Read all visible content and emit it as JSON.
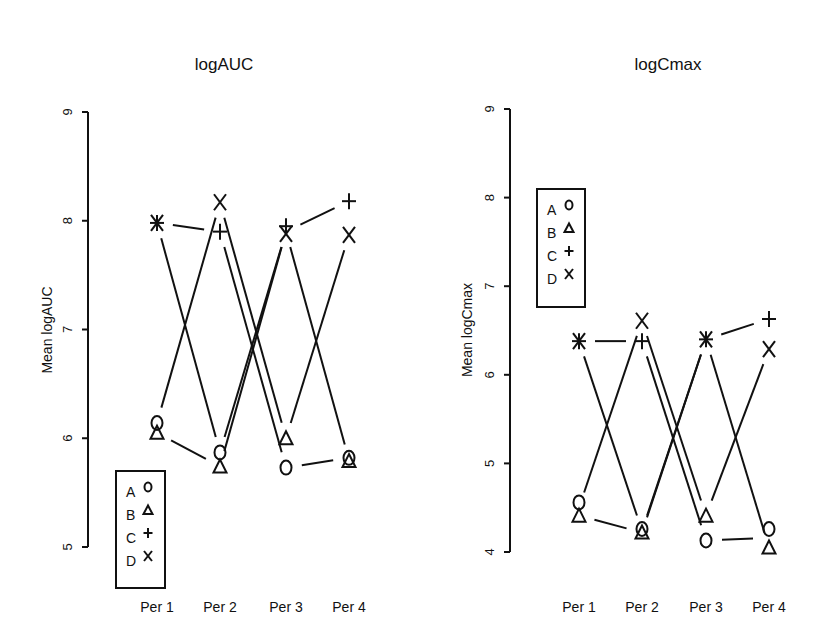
{
  "chart_data": [
    {
      "type": "line",
      "title": "logAUC",
      "xlabel": "",
      "ylabel": "Mean logAUC",
      "categories": [
        "Per 1",
        "Per 2",
        "Per 3",
        "Per 4"
      ],
      "ylim": [
        5,
        9
      ],
      "yticks": [
        5,
        6,
        7,
        8,
        9
      ],
      "grid": false,
      "legend_position": "bottom-left",
      "treatments": [
        {
          "name": "A",
          "marker": "circle",
          "values": [
            6.14,
            5.87,
            5.73,
            5.82
          ]
        },
        {
          "name": "B",
          "marker": "triangle",
          "values": [
            6.05,
            5.74,
            6.0,
            5.79
          ]
        },
        {
          "name": "C",
          "marker": "plus",
          "values": [
            7.98,
            7.9,
            7.95,
            8.18
          ]
        },
        {
          "name": "D",
          "marker": "x",
          "values": [
            7.98,
            8.17,
            7.88,
            7.87
          ]
        }
      ],
      "sequence_lines": [
        [
          7.98,
          7.9,
          5.73,
          5.82
        ],
        [
          7.98,
          5.87,
          7.9,
          5.8
        ],
        [
          6.14,
          8.17,
          6.0,
          7.87
        ],
        [
          6.05,
          5.74,
          7.9,
          8.18
        ]
      ]
    },
    {
      "type": "line",
      "title": "logCmax",
      "xlabel": "",
      "ylabel": "Mean logCmax",
      "categories": [
        "Per 1",
        "Per 2",
        "Per 3",
        "Per 4"
      ],
      "ylim": [
        4,
        9
      ],
      "yticks": [
        4,
        5,
        6,
        7,
        8,
        9
      ],
      "grid": false,
      "legend_position": "top-left",
      "treatments": [
        {
          "name": "A",
          "marker": "circle",
          "values": [
            4.56,
            4.26,
            4.13,
            4.26
          ]
        },
        {
          "name": "B",
          "marker": "triangle",
          "values": [
            4.41,
            4.22,
            4.41,
            4.05
          ]
        },
        {
          "name": "C",
          "marker": "plus",
          "values": [
            6.38,
            6.38,
            6.4,
            6.63
          ]
        },
        {
          "name": "D",
          "marker": "x",
          "values": [
            6.38,
            6.61,
            6.4,
            6.29
          ]
        }
      ],
      "sequence_lines": [
        [
          6.38,
          6.38,
          4.13,
          4.16
        ],
        [
          6.38,
          4.24,
          6.4,
          4.05
        ],
        [
          4.5,
          6.61,
          4.41,
          6.29
        ],
        [
          4.41,
          4.22,
          6.4,
          6.63
        ]
      ]
    }
  ],
  "legend": {
    "entries": [
      {
        "label": "A",
        "marker": "circle"
      },
      {
        "label": "B",
        "marker": "triangle"
      },
      {
        "label": "C",
        "marker": "plus"
      },
      {
        "label": "D",
        "marker": "x"
      }
    ]
  },
  "colors": {
    "ink": "#111111",
    "background": "#ffffff"
  }
}
